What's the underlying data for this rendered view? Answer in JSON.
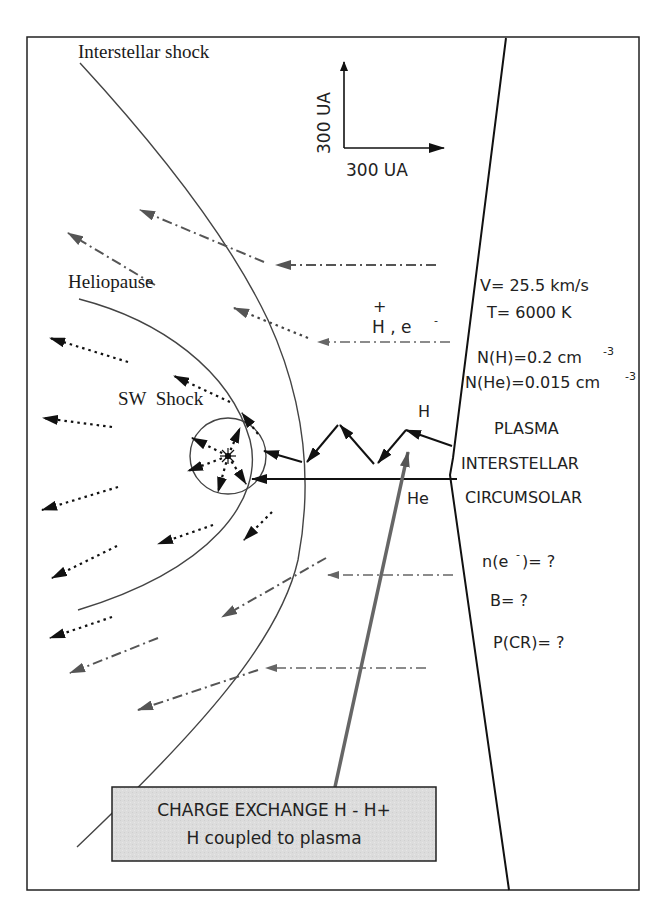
{
  "labels": {
    "interstellar_shock": "Interstellar shock",
    "heliopause": "Heliopause",
    "sw_shock": "SW  Shock",
    "scale_vertical": "300 UA",
    "scale_horizontal": "300 UA",
    "ions": "H , e",
    "ions_plus": "+",
    "ions_minus": "-",
    "h_label": "H",
    "he_label": "He"
  },
  "parameters": {
    "velocity": "V= 25.5 km/s",
    "temperature": "T= 6000 K",
    "nh": "N(H)=0.2 cm",
    "nh_exp": "-3",
    "nhe": "N(He)=0.015 cm",
    "nhe_exp": "-3",
    "plasma_line1": "PLASMA",
    "plasma_line2": "INTERSTELLAR",
    "plasma_line3": "CIRCUMSOLAR",
    "ne": "n(e",
    "ne_sup": "-",
    "ne_tail": ")= ?",
    "b_field": "B= ?",
    "cosmic_rays": "P(CR)= ?"
  },
  "callout": {
    "line1": "CHARGE EXCHANGE H - H+",
    "line2": "H coupled to plasma"
  },
  "colors": {
    "frame": "#222222",
    "callout_fill": "#dcdcdc",
    "gray_arrow": "#555555",
    "black_arrow": "#111111"
  }
}
